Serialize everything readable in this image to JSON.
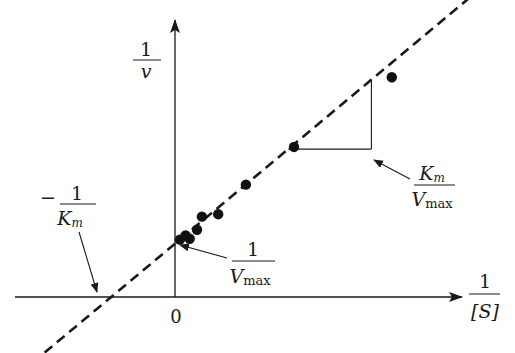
{
  "chart_data": {
    "type": "scatter",
    "title": "",
    "subtitle": "Lineweaver-Burk (double-reciprocal) plot",
    "xlabel": {
      "numerator": "1",
      "denominator": "[S]"
    },
    "ylabel": {
      "numerator": "1",
      "denominator": "v"
    },
    "origin_label": "0",
    "xlim": [
      -1.0,
      3.5
    ],
    "ylim": [
      -0.6,
      3.3
    ],
    "grid": false,
    "legend": "none",
    "fit_line": {
      "style": "dashed",
      "slope": 0.83,
      "intercept": 0.65,
      "x_range": [
        -1.6,
        3.6
      ]
    },
    "points": [
      {
        "x": 0.06,
        "y": 0.7
      },
      {
        "x": 0.13,
        "y": 0.75
      },
      {
        "x": 0.18,
        "y": 0.71
      },
      {
        "x": 0.27,
        "y": 0.82
      },
      {
        "x": 0.33,
        "y": 0.98
      },
      {
        "x": 0.53,
        "y": 1.01
      },
      {
        "x": 0.87,
        "y": 1.37
      },
      {
        "x": 1.46,
        "y": 1.83
      },
      {
        "x": 2.66,
        "y": 2.68
      }
    ],
    "slope_triangle": {
      "x_start": 1.39,
      "x_end": 2.41
    },
    "annotations": [
      {
        "id": "x-intercept",
        "numerator": "1",
        "denominator": "K",
        "denominator_sub": "m",
        "prefix": "−",
        "points_to": "x-intercept"
      },
      {
        "id": "y-intercept",
        "numerator": "1",
        "denominator": "V",
        "denominator_sub": "max",
        "prefix": "",
        "points_to": "y-intercept"
      },
      {
        "id": "slope",
        "numerator": "K",
        "numerator_sub": "m",
        "denominator": "V",
        "denominator_sub": "max",
        "prefix": "",
        "points_to": "slope-triangle"
      }
    ]
  }
}
